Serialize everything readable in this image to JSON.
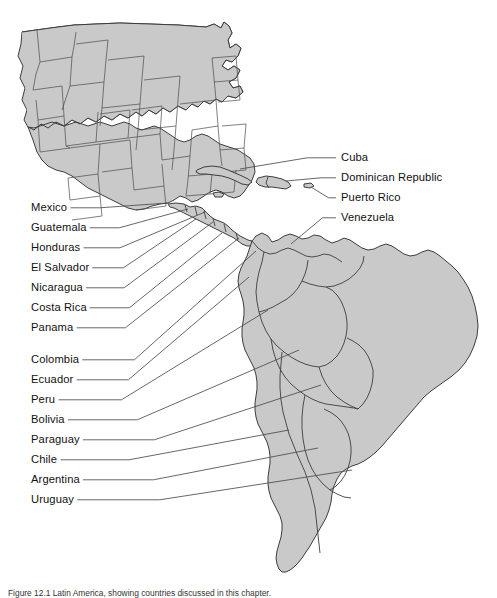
{
  "figure": {
    "name": "latin-america-reference-map",
    "caption": "Figure 12.1 Latin America, showing countries discussed in this chapter.",
    "colors": {
      "land_fill": "#c9c9c9",
      "land_stroke": "#3d3d3d",
      "leader_line": "#4c4c4c",
      "background": "#ffffff",
      "text": "#111111"
    }
  },
  "labels_left": [
    {
      "text": "Mexico",
      "x": 31,
      "y": 202,
      "line_x2": 168,
      "line_y2": 203
    },
    {
      "text": "Guatemala",
      "x": 31,
      "y": 222,
      "line_x2": 188,
      "line_y2": 209
    },
    {
      "text": "Honduras",
      "x": 31,
      "y": 242,
      "line_x2": 205,
      "line_y2": 212
    },
    {
      "text": "El Salvador",
      "x": 31,
      "y": 262,
      "line_x2": 196,
      "line_y2": 219
    },
    {
      "text": "Nicaragua",
      "x": 31,
      "y": 282,
      "line_x2": 213,
      "line_y2": 222
    },
    {
      "text": "Costa Rica",
      "x": 31,
      "y": 302,
      "line_x2": 222,
      "line_y2": 233
    },
    {
      "text": "Panama",
      "x": 31,
      "y": 322,
      "line_x2": 239,
      "line_y2": 238
    },
    {
      "text": "Colombia",
      "x": 31,
      "y": 354,
      "line_x2": 256,
      "line_y2": 251
    },
    {
      "text": "Ecuador",
      "x": 31,
      "y": 374,
      "line_x2": 249,
      "line_y2": 277
    },
    {
      "text": "Peru",
      "x": 31,
      "y": 394,
      "line_x2": 268,
      "line_y2": 310
    },
    {
      "text": "Bolivia",
      "x": 31,
      "y": 414,
      "line_x2": 299,
      "line_y2": 350
    },
    {
      "text": "Paraguay",
      "x": 31,
      "y": 434,
      "line_x2": 321,
      "line_y2": 385
    },
    {
      "text": "Chile",
      "x": 31,
      "y": 454,
      "line_x2": 289,
      "line_y2": 430
    },
    {
      "text": "Argentina",
      "x": 31,
      "y": 474,
      "line_x2": 318,
      "line_y2": 448
    },
    {
      "text": "Uruguay",
      "x": 31,
      "y": 494,
      "line_x2": 352,
      "line_y2": 470
    }
  ],
  "labels_right": [
    {
      "text": "Cuba",
      "x": 341,
      "y": 152,
      "line_x2": 240,
      "line_y2": 169
    },
    {
      "text": "Dominican Republic",
      "x": 341,
      "y": 172,
      "line_x2": 286,
      "line_y2": 181
    },
    {
      "text": "Puerto Rico",
      "x": 341,
      "y": 192,
      "line_x2": 311,
      "line_y2": 187
    },
    {
      "text": "Venezuela",
      "x": 341,
      "y": 212,
      "line_x2": 291,
      "line_y2": 244
    }
  ]
}
